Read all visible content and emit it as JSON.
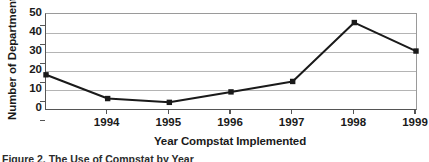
{
  "chart_data": {
    "type": "line",
    "title": "",
    "xlabel": "Year Compstat Implemented",
    "ylabel": "Number of Departments",
    "categories": [
      "1993",
      "1994",
      "1995",
      "1996",
      "1997",
      "1998",
      "1999"
    ],
    "x_ticklabels": [
      "1994",
      "1995",
      "1996",
      "1997",
      "1998",
      "1999"
    ],
    "values": [
      18,
      5.5,
      3.5,
      9,
      14.5,
      45.5,
      30.5
    ],
    "y_ticks": [
      0,
      10,
      20,
      30,
      40,
      50
    ],
    "ylim": [
      0,
      50
    ],
    "xlim": [
      "1993",
      "1999"
    ],
    "grid": "horizontal",
    "legend": "none",
    "series_color": "#1a1a1a",
    "marker": "square",
    "gridline_color": "#b4b4b4",
    "axis_color": "#555555"
  },
  "figure": {
    "caption": "Figure 2. The Use of Compstat by Year"
  }
}
